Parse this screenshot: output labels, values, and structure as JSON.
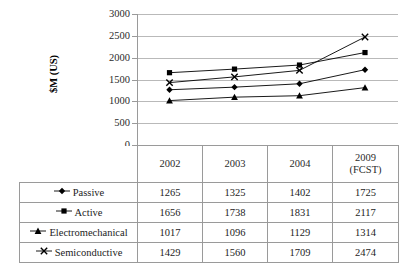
{
  "chart_data": {
    "type": "line",
    "title": "",
    "xlabel": "",
    "ylabel": "$M (US)",
    "categories": [
      "2002",
      "2003",
      "2004",
      "2009 (FCST)"
    ],
    "ylim": [
      0,
      3000
    ],
    "ytick_step": 500,
    "yticks": [
      "3000",
      "2500",
      "2000",
      "1500",
      "1000",
      "500",
      "0"
    ],
    "grid": true,
    "legend_position": "table-row-labels",
    "series": [
      {
        "name": "Passive",
        "marker": "diamond",
        "values": [
          1265,
          1325,
          1402,
          1725
        ]
      },
      {
        "name": "Active",
        "marker": "square",
        "values": [
          1656,
          1738,
          1831,
          2117
        ]
      },
      {
        "name": "Electromechanical",
        "marker": "triangle",
        "values": [
          1017,
          1096,
          1129,
          1314
        ]
      },
      {
        "name": "Semiconductive",
        "marker": "cross",
        "values": [
          1429,
          1560,
          1709,
          2474
        ]
      }
    ]
  },
  "axis": {
    "y_title": "$M (US)"
  },
  "table": {
    "corner_label": "",
    "column_headers": [
      {
        "line1": "2002",
        "line2": ""
      },
      {
        "line1": "2003",
        "line2": ""
      },
      {
        "line1": "2004",
        "line2": ""
      },
      {
        "line1": "2009",
        "line2": "(FCST)"
      }
    ],
    "rows": [
      {
        "label": "Passive",
        "marker": "diamond",
        "values": [
          "1265",
          "1325",
          "1402",
          "1725"
        ]
      },
      {
        "label": "Active",
        "marker": "square",
        "values": [
          "1656",
          "1738",
          "1831",
          "2117"
        ]
      },
      {
        "label": "Electromechanical",
        "marker": "triangle",
        "values": [
          "1017",
          "1096",
          "1129",
          "1314"
        ]
      },
      {
        "label": "Semiconductive",
        "marker": "cross",
        "values": [
          "1429",
          "1560",
          "1709",
          "2474"
        ]
      }
    ]
  },
  "colors": {
    "series": "#000000",
    "grid": "#b9b9b9",
    "axis": "#9a9a9a",
    "text": "#1c1c1c",
    "background": "#ffffff"
  }
}
